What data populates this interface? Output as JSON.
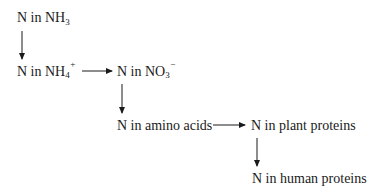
{
  "diagram": {
    "type": "flow",
    "title": "",
    "nodes": [
      {
        "id": "nh3",
        "prefix": "N in NH",
        "sub": "3",
        "sup": "",
        "label": "N in NH3"
      },
      {
        "id": "nh4",
        "prefix": "N in NH",
        "sub": "4",
        "sup": "+",
        "label": "N in NH4+"
      },
      {
        "id": "no3",
        "prefix": "N in NO",
        "sub": "3",
        "sup": "−",
        "label": "N in NO3−"
      },
      {
        "id": "amino",
        "prefix": "N in amino acids",
        "sub": "",
        "sup": "",
        "label": "N in amino acids"
      },
      {
        "id": "plant",
        "prefix": "N in plant proteins",
        "sub": "",
        "sup": "",
        "label": "N in plant proteins"
      },
      {
        "id": "human",
        "prefix": "N in human proteins",
        "sub": "",
        "sup": "",
        "label": "N in human proteins"
      }
    ],
    "edges": [
      {
        "from": "nh3",
        "to": "nh4",
        "direction": "down"
      },
      {
        "from": "nh4",
        "to": "no3",
        "direction": "right"
      },
      {
        "from": "no3",
        "to": "amino",
        "direction": "down"
      },
      {
        "from": "amino",
        "to": "plant",
        "direction": "right"
      },
      {
        "from": "plant",
        "to": "human",
        "direction": "down"
      }
    ],
    "colors": {
      "text": "#1a1a1a",
      "arrow": "#1a1a1a",
      "background": "#ffffff"
    }
  }
}
